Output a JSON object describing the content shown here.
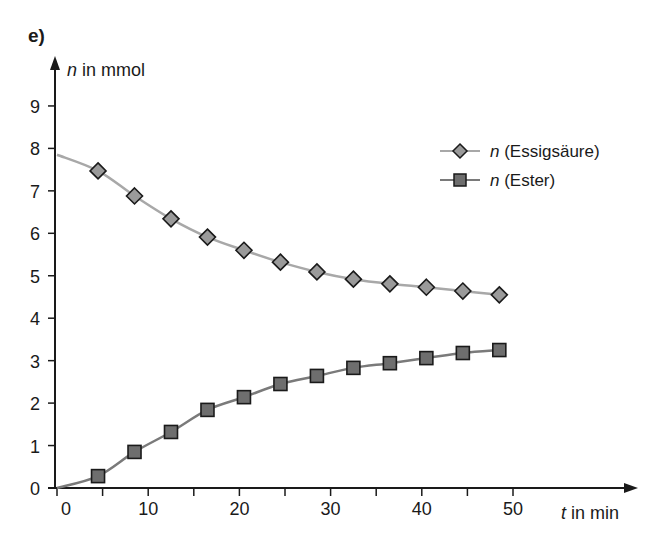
{
  "chart_data": {
    "type": "line",
    "panel_label": "e)",
    "title": "",
    "xlabel": "t in min",
    "xlabel_var": "t",
    "xlabel_rest": " in min",
    "ylabel": "n in mmol",
    "ylabel_var": "n",
    "ylabel_rest": " in mmol",
    "xlim": [
      0,
      55
    ],
    "ylim": [
      0,
      9.8
    ],
    "x_ticks_major": [
      0,
      10,
      20,
      30,
      40,
      50
    ],
    "x_ticks_minor": [
      5,
      15,
      25,
      35,
      45
    ],
    "y_ticks": [
      0,
      1,
      2,
      3,
      4,
      5,
      6,
      7,
      8,
      9
    ],
    "grid": false,
    "legend_position": "upper right",
    "series": [
      {
        "name": "n (Essigsäure)",
        "label_var": "n",
        "label_rest": " (Essigsäure)",
        "marker": "diamond",
        "line_color": "#a8a8a8",
        "marker_fill": "#9a9a9a",
        "start_value": 7.85,
        "x": [
          4.5,
          8.5,
          12.5,
          16.5,
          20.5,
          24.5,
          28.5,
          32.5,
          36.5,
          40.5,
          44.5,
          48.5
        ],
        "values": [
          7.47,
          6.88,
          6.34,
          5.91,
          5.6,
          5.32,
          5.09,
          4.92,
          4.81,
          4.73,
          4.64,
          4.55
        ]
      },
      {
        "name": "n (Ester)",
        "label_var": "n",
        "label_rest": " (Ester)",
        "marker": "square",
        "line_color": "#7a7a7a",
        "marker_fill": "#6e6e6e",
        "start_value": 0,
        "x": [
          4.5,
          8.5,
          12.5,
          16.5,
          20.5,
          24.5,
          28.5,
          32.5,
          36.5,
          40.5,
          44.5,
          48.5
        ],
        "values": [
          0.28,
          0.85,
          1.32,
          1.84,
          2.14,
          2.45,
          2.64,
          2.83,
          2.94,
          3.06,
          3.18,
          3.25
        ]
      }
    ]
  }
}
